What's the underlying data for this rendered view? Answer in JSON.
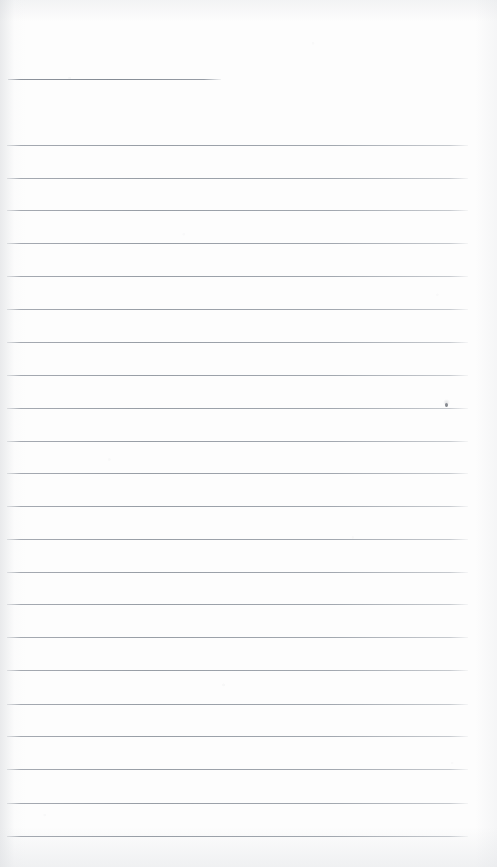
{
  "document": {
    "type": "lined-notepad-page",
    "description": "Blank scanned ruled notepad page",
    "width_px": 497,
    "height_px": 867,
    "paper_color": "#fdfdfd",
    "rule_color": "#989ea6",
    "heading_rule_color": "#848b94",
    "text_content": "",
    "visible_text": ""
  },
  "header_rule": {
    "name": "heading-rule",
    "x_start": 8,
    "x_end": 221,
    "y": 79
  },
  "rules": [
    {
      "y": 145,
      "x_start": 7,
      "x_end": 468
    },
    {
      "y": 178,
      "x_start": 7,
      "x_end": 468
    },
    {
      "y": 210,
      "x_start": 7,
      "x_end": 468
    },
    {
      "y": 243,
      "x_start": 7,
      "x_end": 468
    },
    {
      "y": 276,
      "x_start": 7,
      "x_end": 468
    },
    {
      "y": 309,
      "x_start": 7,
      "x_end": 468
    },
    {
      "y": 342,
      "x_start": 7,
      "x_end": 468
    },
    {
      "y": 375,
      "x_start": 7,
      "x_end": 468
    },
    {
      "y": 408,
      "x_start": 7,
      "x_end": 468
    },
    {
      "y": 441,
      "x_start": 7,
      "x_end": 468
    },
    {
      "y": 473,
      "x_start": 7,
      "x_end": 468
    },
    {
      "y": 506,
      "x_start": 7,
      "x_end": 468
    },
    {
      "y": 539,
      "x_start": 7,
      "x_end": 468
    },
    {
      "y": 572,
      "x_start": 7,
      "x_end": 468
    },
    {
      "y": 604,
      "x_start": 7,
      "x_end": 468
    },
    {
      "y": 637,
      "x_start": 7,
      "x_end": 468
    },
    {
      "y": 670,
      "x_start": 7,
      "x_end": 468
    },
    {
      "y": 704,
      "x_start": 7,
      "x_end": 468
    },
    {
      "y": 736,
      "x_start": 7,
      "x_end": 468
    },
    {
      "y": 769,
      "x_start": 7,
      "x_end": 468
    },
    {
      "y": 803,
      "x_start": 7,
      "x_end": 468
    },
    {
      "y": 836,
      "x_start": 7,
      "x_end": 468
    }
  ],
  "marks": [
    {
      "name": "ink-speck",
      "x": 445,
      "y": 403
    }
  ]
}
